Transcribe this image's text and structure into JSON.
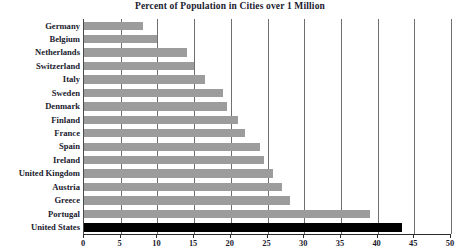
{
  "chart_data": {
    "type": "bar",
    "orientation": "horizontal",
    "title": "Percent of Population in Cities over 1 Million",
    "xlabel": "",
    "ylabel": "",
    "xlim": [
      0,
      50
    ],
    "xticks": [
      0,
      5,
      10,
      15,
      20,
      25,
      30,
      35,
      40,
      45,
      50
    ],
    "grid": true,
    "legend": null,
    "categories": [
      "Germany",
      "Belgium",
      "Netherlands",
      "Switzerland",
      "Italy",
      "Sweden",
      "Denmark",
      "Finland",
      "France",
      "Spain",
      "Ireland",
      "United Kingdom",
      "Austria",
      "Greece",
      "Portugal",
      "United States"
    ],
    "values": [
      8,
      10,
      14,
      15,
      16.5,
      19,
      19.5,
      21,
      22,
      24,
      24.5,
      25.8,
      27,
      28,
      39,
      43.3
    ],
    "bar_color": "#9c9c9c",
    "highlight_color": "#000000",
    "highlighted_category": "United States"
  },
  "colors": {
    "background": "#ffffff",
    "text": "#1a1a2e",
    "axis": "#2b2b2b",
    "gridline": "#6f6f6f",
    "bar": "#9c9c9c",
    "bar_highlight": "#000000"
  }
}
